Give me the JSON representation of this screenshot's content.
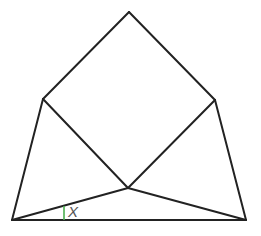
{
  "diagram": {
    "type": "geometry",
    "points": {
      "top": [
        129,
        12
      ],
      "left": [
        43,
        99
      ],
      "right": [
        215,
        100
      ],
      "center": [
        128,
        188
      ],
      "bottom_left": [
        12,
        220
      ],
      "bottom_right": [
        246,
        220
      ]
    },
    "edges": [
      [
        "top",
        "left"
      ],
      [
        "top",
        "right"
      ],
      [
        "left",
        "center"
      ],
      [
        "right",
        "center"
      ],
      [
        "left",
        "bottom_left"
      ],
      [
        "right",
        "bottom_right"
      ],
      [
        "bottom_left",
        "bottom_right"
      ],
      [
        "bottom_left",
        "center"
      ],
      [
        "center",
        "bottom_right"
      ]
    ],
    "angle": {
      "label": "X",
      "vertex": "bottom_left",
      "between": [
        "center",
        "bottom_right"
      ],
      "mark_color": "#4caf50"
    }
  }
}
